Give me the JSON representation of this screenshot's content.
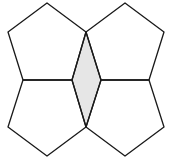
{
  "diagram": {
    "colors": {
      "stroke": "#1a1a1a",
      "shaded_fill": "#e6e6e6",
      "background": "#ffffff"
    },
    "pentagons": [
      {
        "name": "top-left",
        "points": "47,3 86,32 72,80 23,80 8,32"
      },
      {
        "name": "top-right",
        "points": "125,3 164,32 149,80 101,80 86,32"
      },
      {
        "name": "bottom-left",
        "points": "23,80 72,80 86,127 47,156 8,127"
      },
      {
        "name": "bottom-right",
        "points": "101,80 149,80 164,127 125,156 86,127"
      }
    ],
    "rhombus": {
      "name": "shaded-rhombus",
      "points": "86,32 101,80 86,127 72,80"
    }
  }
}
